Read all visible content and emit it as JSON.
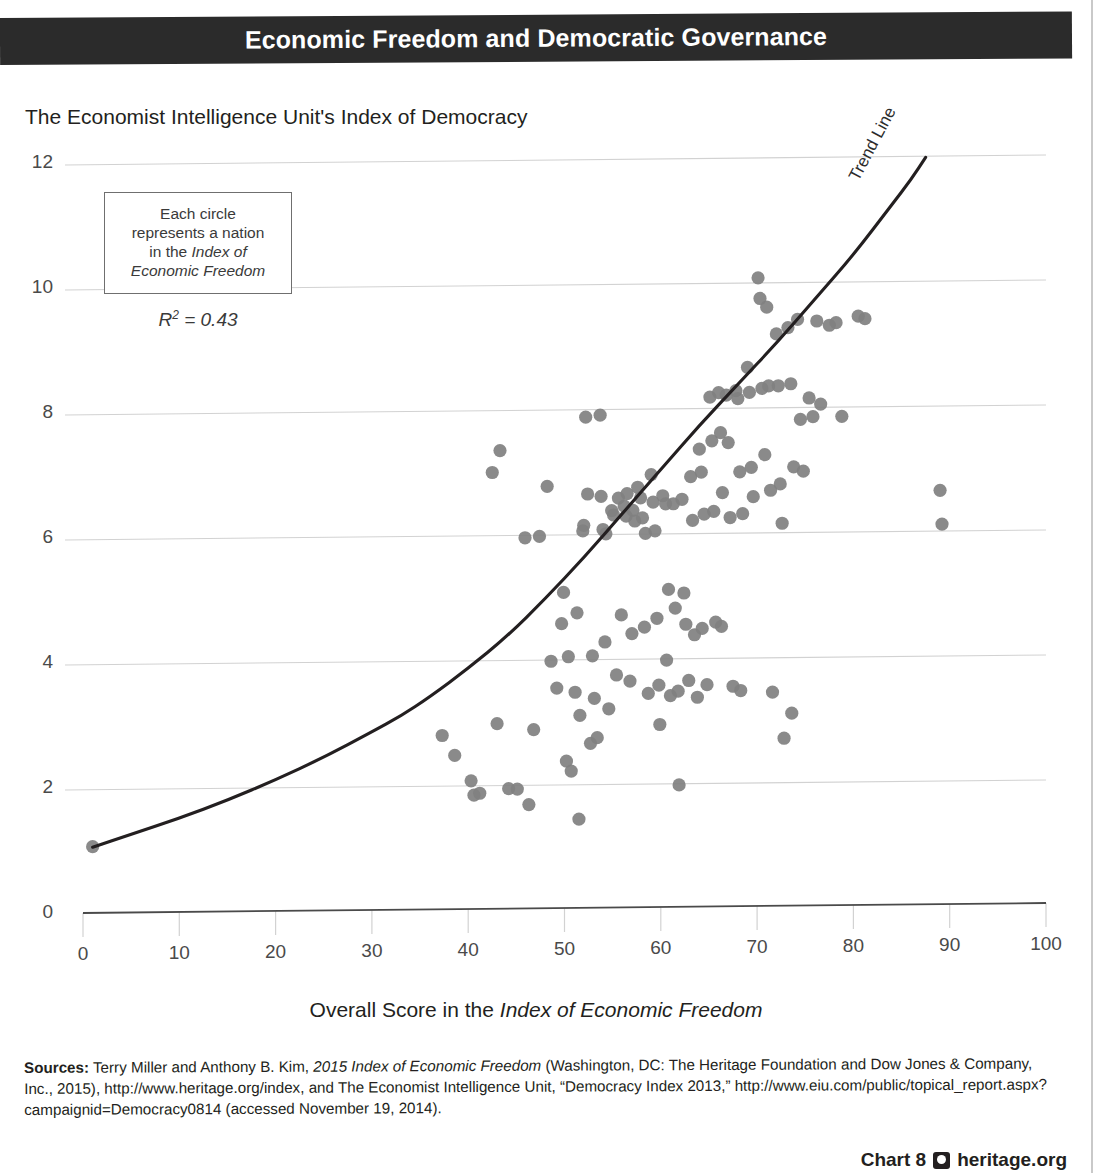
{
  "banner": {
    "title": "Economic Freedom and Democratic Governance"
  },
  "chart_subtitle": "The Economist Intelligence Unit's Index of Democracy",
  "callout": {
    "line1": "Each circle",
    "line2": "represents a nation",
    "line3_plain": "in the ",
    "line3_italic": "Index of",
    "line4_italic": "Economic Freedom",
    "r2_label": "R",
    "r2_sup": "2",
    "r2_value": " = 0.43"
  },
  "trend_label": "Trend Line",
  "xaxis_title_plain": "Overall Score in the ",
  "xaxis_title_italic": "Index of Economic Freedom",
  "sources": {
    "label": "Sources:",
    "text_a": " Terry Miller and Anthony B. Kim, ",
    "text_b_italic": "2015 Index of Economic Freedom",
    "text_c": " (Washington, DC: The Heritage Foundation and Dow Jones & Company, Inc., 2015), http://www.heritage.org/index, and The Economist Intelligence Unit, “Democracy Index 2013,” http://www.eiu.com/public/topical_report.aspx?campaignid=Democracy0814 (accessed November 19, 2014)."
  },
  "footer": {
    "chart_number": "Chart 8",
    "logo_name": "heritage-logo",
    "site": "heritage.org"
  },
  "colors": {
    "banner_bg": "#2b2b2b",
    "dot": "#808080",
    "trend_line": "#231f20",
    "gridline": "#d2d2d2",
    "axis": "#555555",
    "text": "#231f20"
  },
  "chart_data": {
    "type": "scatter",
    "title": "Economic Freedom and Democratic Governance",
    "subtitle": "The Economist Intelligence Unit's Index of Democracy",
    "xlabel": "Overall Score in the Index of Economic Freedom",
    "ylabel": "The Economist Intelligence Unit's Index of Democracy",
    "xlim": [
      0,
      100
    ],
    "ylim": [
      0,
      12
    ],
    "xticks": [
      0,
      10,
      20,
      30,
      40,
      50,
      60,
      70,
      80,
      90,
      100
    ],
    "yticks": [
      0,
      2,
      4,
      6,
      8,
      10,
      12
    ],
    "grid": "horizontal",
    "legend": "none",
    "r_squared": 0.43,
    "annotations": [
      "Each circle represents a nation in the Index of Economic Freedom",
      "R² = 0.43",
      "Trend Line"
    ],
    "trend_line": {
      "label": "Trend Line",
      "type": "exponential",
      "points": [
        [
          1.0,
          1.05
        ],
        [
          5,
          1.25
        ],
        [
          10,
          1.5
        ],
        [
          15,
          1.78
        ],
        [
          20,
          2.1
        ],
        [
          25,
          2.45
        ],
        [
          30,
          2.85
        ],
        [
          33,
          3.1
        ],
        [
          36,
          3.4
        ],
        [
          40,
          3.85
        ],
        [
          44,
          4.35
        ],
        [
          48,
          4.95
        ],
        [
          52,
          5.6
        ],
        [
          56,
          6.3
        ],
        [
          60,
          7.0
        ],
        [
          64,
          7.7
        ],
        [
          68,
          8.35
        ],
        [
          72,
          9.0
        ],
        [
          76,
          9.7
        ],
        [
          80,
          10.4
        ],
        [
          84,
          11.2
        ],
        [
          86,
          11.6
        ],
        [
          87.5,
          11.95
        ]
      ]
    },
    "points": [
      [
        1.0,
        1.06
      ],
      [
        37.3,
        2.78
      ],
      [
        38.6,
        2.46
      ],
      [
        40.3,
        2.05
      ],
      [
        40.6,
        1.82
      ],
      [
        41.2,
        1.85
      ],
      [
        42.5,
        6.98
      ],
      [
        43.3,
        7.33
      ],
      [
        43.0,
        2.96
      ],
      [
        44.2,
        1.92
      ],
      [
        45.1,
        1.91
      ],
      [
        45.9,
        5.93
      ],
      [
        46.3,
        1.66
      ],
      [
        46.8,
        2.86
      ],
      [
        47.4,
        5.95
      ],
      [
        48.2,
        6.75
      ],
      [
        48.6,
        3.95
      ],
      [
        49.2,
        3.52
      ],
      [
        49.7,
        4.55
      ],
      [
        49.9,
        5.05
      ],
      [
        50.4,
        4.02
      ],
      [
        50.2,
        2.35
      ],
      [
        50.7,
        2.19
      ],
      [
        51.1,
        3.45
      ],
      [
        51.3,
        4.72
      ],
      [
        51.6,
        3.08
      ],
      [
        51.5,
        1.42
      ],
      [
        51.9,
        6.03
      ],
      [
        52.0,
        6.12
      ],
      [
        52.4,
        6.62
      ],
      [
        52.2,
        7.85
      ],
      [
        52.7,
        2.63
      ],
      [
        52.9,
        4.03
      ],
      [
        53.1,
        3.35
      ],
      [
        53.4,
        2.72
      ],
      [
        53.7,
        7.88
      ],
      [
        53.8,
        6.58
      ],
      [
        54.0,
        6.05
      ],
      [
        54.3,
        5.98
      ],
      [
        54.2,
        4.25
      ],
      [
        54.6,
        3.18
      ],
      [
        54.9,
        6.35
      ],
      [
        55.1,
        6.28
      ],
      [
        55.4,
        3.72
      ],
      [
        55.6,
        6.55
      ],
      [
        55.9,
        4.68
      ],
      [
        56.2,
        6.42
      ],
      [
        56.5,
        6.62
      ],
      [
        56.4,
        6.26
      ],
      [
        56.8,
        3.62
      ],
      [
        57.1,
        6.35
      ],
      [
        57.3,
        6.18
      ],
      [
        57.0,
        4.38
      ],
      [
        57.6,
        6.72
      ],
      [
        57.9,
        6.55
      ],
      [
        58.1,
        6.23
      ],
      [
        58.4,
        5.98
      ],
      [
        58.3,
        4.48
      ],
      [
        58.7,
        3.42
      ],
      [
        59.0,
        6.92
      ],
      [
        59.2,
        6.48
      ],
      [
        59.4,
        6.02
      ],
      [
        59.6,
        4.62
      ],
      [
        59.8,
        3.55
      ],
      [
        59.9,
        2.92
      ],
      [
        60.2,
        6.58
      ],
      [
        60.5,
        6.45
      ],
      [
        60.8,
        5.08
      ],
      [
        60.6,
        3.95
      ],
      [
        61.0,
        3.38
      ],
      [
        61.3,
        6.45
      ],
      [
        61.5,
        4.78
      ],
      [
        61.8,
        3.45
      ],
      [
        61.9,
        1.95
      ],
      [
        62.2,
        6.52
      ],
      [
        62.4,
        5.02
      ],
      [
        62.6,
        4.52
      ],
      [
        62.9,
        3.62
      ],
      [
        63.1,
        6.88
      ],
      [
        63.3,
        6.18
      ],
      [
        63.5,
        4.35
      ],
      [
        63.8,
        3.35
      ],
      [
        64.0,
        7.32
      ],
      [
        64.2,
        6.95
      ],
      [
        64.5,
        6.28
      ],
      [
        64.3,
        4.45
      ],
      [
        64.8,
        3.55
      ],
      [
        65.1,
        8.15
      ],
      [
        65.3,
        7.45
      ],
      [
        65.5,
        6.32
      ],
      [
        65.7,
        4.55
      ],
      [
        66.0,
        8.22
      ],
      [
        66.2,
        7.58
      ],
      [
        66.4,
        6.62
      ],
      [
        66.3,
        4.48
      ],
      [
        66.8,
        8.18
      ],
      [
        67.0,
        7.42
      ],
      [
        67.2,
        6.22
      ],
      [
        67.5,
        3.52
      ],
      [
        67.8,
        8.25
      ],
      [
        68.0,
        8.12
      ],
      [
        68.2,
        6.95
      ],
      [
        68.5,
        6.28
      ],
      [
        68.3,
        3.45
      ],
      [
        69.0,
        8.62
      ],
      [
        69.2,
        8.22
      ],
      [
        69.4,
        7.02
      ],
      [
        69.6,
        6.55
      ],
      [
        70.1,
        10.05
      ],
      [
        70.3,
        9.72
      ],
      [
        70.5,
        8.28
      ],
      [
        70.8,
        7.22
      ],
      [
        71.0,
        9.58
      ],
      [
        71.2,
        8.32
      ],
      [
        71.4,
        6.65
      ],
      [
        71.6,
        3.42
      ],
      [
        72.0,
        9.15
      ],
      [
        72.2,
        8.32
      ],
      [
        72.4,
        6.75
      ],
      [
        72.6,
        6.12
      ],
      [
        72.8,
        2.68
      ],
      [
        73.2,
        9.25
      ],
      [
        73.5,
        8.35
      ],
      [
        73.8,
        7.02
      ],
      [
        73.6,
        3.08
      ],
      [
        74.2,
        9.38
      ],
      [
        74.5,
        7.78
      ],
      [
        74.8,
        6.95
      ],
      [
        75.4,
        8.12
      ],
      [
        75.8,
        7.82
      ],
      [
        76.2,
        9.35
      ],
      [
        76.6,
        8.02
      ],
      [
        77.5,
        9.28
      ],
      [
        78.2,
        9.32
      ],
      [
        78.8,
        7.82
      ],
      [
        80.5,
        9.42
      ],
      [
        81.2,
        9.38
      ],
      [
        89.0,
        6.62
      ],
      [
        89.2,
        6.08
      ]
    ]
  }
}
